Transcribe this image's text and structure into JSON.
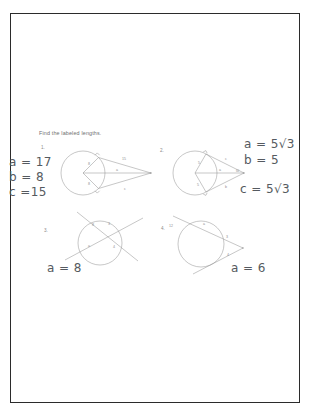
{
  "page": {
    "background_color": "#f2f2f2",
    "sheet_color": "#ffffff",
    "border_color": "#2b2b2b",
    "title": "Find the labeled lengths."
  },
  "prompt": {
    "text": "Find the labeled lengths."
  },
  "figures": [
    {
      "number": "1.",
      "type": "circle-with-two-tangents",
      "labels": [
        "8",
        "15",
        "8",
        "c",
        "a"
      ]
    },
    {
      "number": "2.",
      "type": "circle-with-two-tangents",
      "labels": [
        "5",
        "c",
        "5",
        "b",
        "a",
        "60"
      ]
    },
    {
      "number": "3.",
      "type": "two-intersecting-chords",
      "labels": [
        "8",
        "3",
        "a",
        "4"
      ]
    },
    {
      "number": "4.",
      "type": "secant-and-tangent",
      "labels": [
        "12",
        "a",
        "3",
        "4"
      ]
    }
  ],
  "answers": {
    "figure1": {
      "a": "a = 17",
      "b": "b = 8",
      "c": "c =15"
    },
    "figure2": {
      "a": "a = 5√3",
      "b": "b = 5",
      "c": "c = 5√3"
    },
    "figure3": {
      "a": "a = 8"
    },
    "figure4": {
      "a": "a = 6"
    }
  },
  "ink_colors": {
    "printed": "#8a8a8a",
    "handwriting": "#555a60"
  }
}
